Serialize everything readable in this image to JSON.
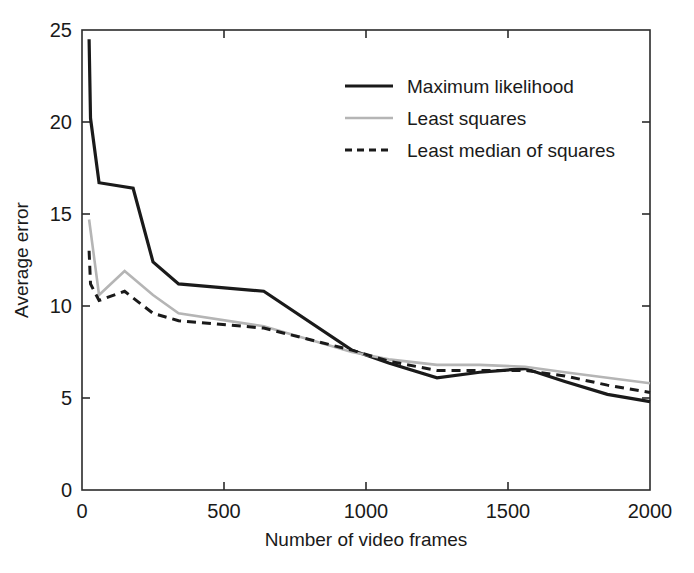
{
  "chart_data": {
    "type": "line",
    "title": "",
    "xlabel": "Number of video frames",
    "ylabel": "Average error",
    "xlim": [
      0,
      2000
    ],
    "ylim": [
      0,
      25
    ],
    "xticks": [
      0,
      500,
      1000,
      1500,
      2000
    ],
    "yticks": [
      0,
      5,
      10,
      15,
      20,
      25
    ],
    "xtick_labels": [
      "0",
      "500",
      "1000",
      "1500",
      "2000"
    ],
    "ytick_labels": [
      "0",
      "5",
      "10",
      "15",
      "20",
      "25"
    ],
    "grid": false,
    "legend_position": "upper right",
    "series": [
      {
        "name": "Maximum likelihood",
        "color": "#1a1a1a",
        "style": "solid",
        "width": 3.2,
        "x": [
          25,
          30,
          60,
          180,
          250,
          340,
          640,
          950,
          1080,
          1250,
          1400,
          1560,
          1700,
          1850,
          2000
        ],
        "y": [
          24.5,
          20.2,
          16.7,
          16.4,
          12.4,
          11.2,
          10.8,
          7.6,
          6.9,
          6.1,
          6.4,
          6.6,
          5.9,
          5.2,
          4.8
        ]
      },
      {
        "name": "Least squares",
        "color": "#b5b5b5",
        "style": "solid",
        "width": 2.6,
        "x": [
          25,
          60,
          150,
          250,
          340,
          640,
          950,
          1080,
          1250,
          1400,
          1560,
          1700,
          1850,
          2000
        ],
        "y": [
          14.7,
          10.6,
          11.9,
          10.6,
          9.6,
          8.9,
          7.5,
          7.1,
          6.8,
          6.8,
          6.7,
          6.4,
          6.1,
          5.8
        ]
      },
      {
        "name": "Least median of squares",
        "color": "#1a1a1a",
        "style": "dashed",
        "width": 3.0,
        "x": [
          25,
          30,
          60,
          150,
          250,
          340,
          640,
          950,
          1080,
          1250,
          1400,
          1560,
          1700,
          1850,
          2000
        ],
        "y": [
          13.0,
          11.2,
          10.3,
          10.8,
          9.6,
          9.2,
          8.8,
          7.6,
          7.0,
          6.5,
          6.5,
          6.5,
          6.2,
          5.7,
          5.3
        ]
      }
    ],
    "legend_entries": [
      {
        "label": "Maximum likelihood",
        "swatch": "solid-black"
      },
      {
        "label": "Least squares",
        "swatch": "solid-gray"
      },
      {
        "label": "Least median of squares",
        "swatch": "dashed-black"
      }
    ]
  }
}
